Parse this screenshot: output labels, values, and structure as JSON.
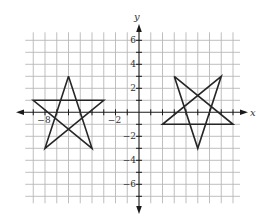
{
  "chart_data": {
    "type": "line",
    "title": "",
    "xlabel": "x",
    "ylabel": "y",
    "xlim": [
      -9,
      8
    ],
    "ylim": [
      -7,
      6
    ],
    "grid": true,
    "x_tick_labels": [
      {
        "value": -8,
        "label": "−8"
      },
      {
        "value": -2,
        "label": "−2"
      }
    ],
    "y_tick_labels": [
      {
        "value": 6,
        "label": "6"
      },
      {
        "value": 4,
        "label": "4"
      },
      {
        "value": 2,
        "label": "2"
      },
      {
        "value": -2,
        "label": "−2"
      },
      {
        "value": -4,
        "label": "−4"
      },
      {
        "value": -6,
        "label": "−6"
      }
    ],
    "series": [
      {
        "name": "left-star",
        "closed": true,
        "vertices": [
          [
            -6,
            3
          ],
          [
            -9,
            1
          ],
          [
            -3,
            1
          ],
          [
            -8,
            -3
          ],
          [
            -4,
            -3
          ]
        ],
        "path": [
          [
            -6,
            3
          ],
          [
            -8,
            -3
          ],
          [
            -3,
            1
          ],
          [
            -9,
            1
          ],
          [
            -4,
            -3
          ],
          [
            -6,
            3
          ]
        ]
      },
      {
        "name": "right-star",
        "closed": true,
        "vertices": [
          [
            3,
            3
          ],
          [
            7,
            3
          ],
          [
            2,
            -1
          ],
          [
            8,
            -1
          ],
          [
            5,
            -3
          ]
        ],
        "path": [
          [
            3,
            3
          ],
          [
            8,
            -1
          ],
          [
            2,
            -1
          ],
          [
            7,
            3
          ],
          [
            5,
            -3
          ],
          [
            3,
            3
          ]
        ]
      }
    ]
  },
  "colors": {
    "grid": "#b8b8b8",
    "axis": "#1a1a1a",
    "shape": "#262626",
    "background": "#ffffff"
  }
}
